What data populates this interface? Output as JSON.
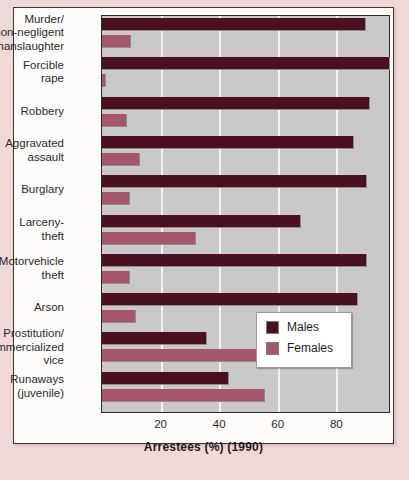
{
  "figure": {
    "axis_title": "Arrestees (%) (1990)",
    "legend": {
      "items": [
        {
          "label": "Males",
          "color": "#4a1020"
        },
        {
          "label": "Females",
          "color": "#a5566b"
        }
      ]
    }
  },
  "chart_data": {
    "type": "bar",
    "orientation": "horizontal",
    "title": "",
    "xlabel": "Arrestees (%) (1990)",
    "ylabel": "",
    "xlim": [
      0,
      98
    ],
    "xticks": [
      20,
      40,
      60,
      80
    ],
    "xtick_labels": [
      "20",
      "40",
      "60",
      "80"
    ],
    "grid": "vertical",
    "legend_position": "lower-right",
    "categories": [
      "Murder/\nnon-negligent\nmanslaughter",
      "Forcible\nrape",
      "Robbery",
      "Aggravated\nassault",
      "Burglary",
      "Larceny-\ntheft",
      "Motorvehicle\ntheft",
      "Arson",
      "Prostitution/\ncommercialized\nvice",
      "Runaways\n(juvenile)"
    ],
    "series": [
      {
        "name": "Males",
        "color": "#4a1020",
        "values": [
          90,
          98.5,
          91.5,
          86,
          90.5,
          68,
          90.5,
          87.5,
          36,
          43.5
        ]
      },
      {
        "name": "Females",
        "color": "#a5566b",
        "values": [
          10,
          1.5,
          8.5,
          13,
          9.5,
          32,
          9.5,
          11.5,
          64,
          55.5
        ]
      }
    ]
  }
}
